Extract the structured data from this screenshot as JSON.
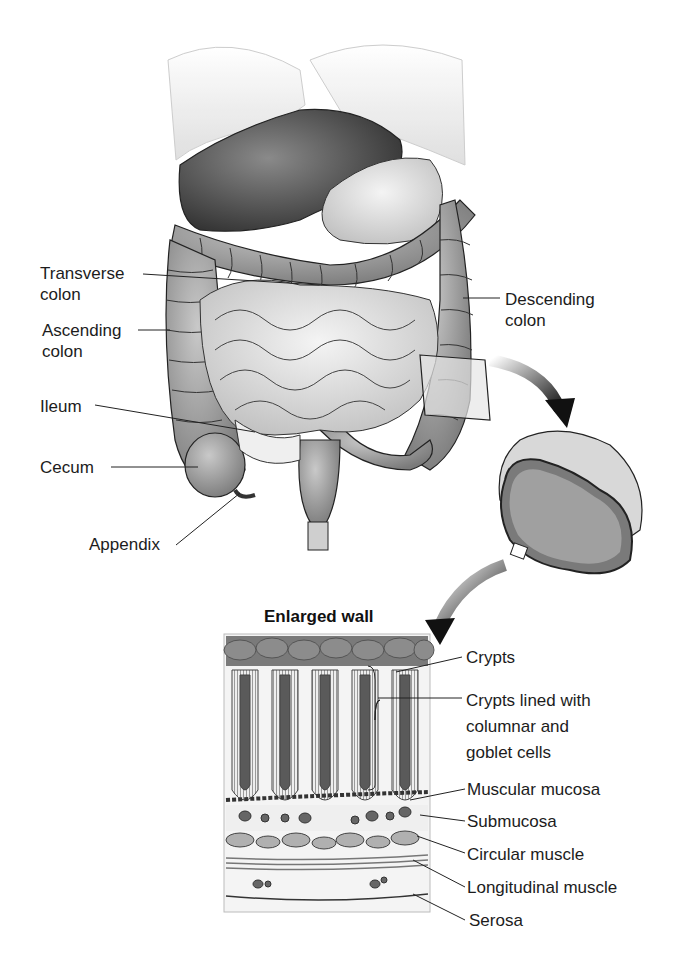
{
  "figure": {
    "colors": {
      "ink": "#1c1c1c",
      "organ_dark": "#5a5a5a",
      "organ_mid": "#9a9a9a",
      "organ_light": "#d4d4d4",
      "background": "#ffffff"
    }
  },
  "labels": {
    "transverse_colon": [
      "Transverse",
      "colon"
    ],
    "ascending_colon": [
      "Ascending",
      "colon"
    ],
    "ileum": "Ileum",
    "cecum": "Cecum",
    "appendix": "Appendix",
    "descending_colon": [
      "Descending",
      "colon"
    ]
  },
  "enlarged_wall": {
    "title": "Enlarged wall",
    "labels": {
      "crypts": "Crypts",
      "crypts_lined": [
        "Crypts lined with",
        "columnar and",
        "goblet cells"
      ],
      "muscular_mucosa": "Muscular mucosa",
      "submucosa": "Submucosa",
      "circular_muscle": "Circular muscle",
      "longitudinal_muscle": "Longitudinal muscle",
      "serosa": "Serosa"
    }
  }
}
